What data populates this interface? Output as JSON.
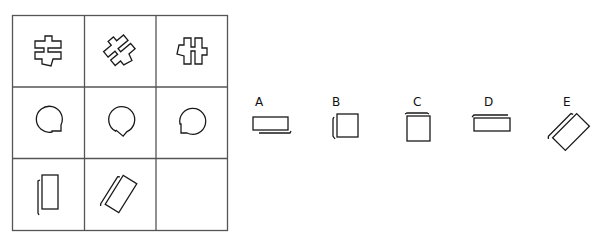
{
  "puzzle": {
    "type": "3x3 figure matrix with missing cell",
    "grid": {
      "rows": 3,
      "cols": 3,
      "cells": [
        {
          "row": 0,
          "col": 0,
          "figure": "cross-puzzle-shape",
          "rotation_deg": 0
        },
        {
          "row": 0,
          "col": 1,
          "figure": "cross-puzzle-shape",
          "rotation_deg": -45
        },
        {
          "row": 0,
          "col": 2,
          "figure": "cross-puzzle-shape",
          "rotation_deg": 90
        },
        {
          "row": 1,
          "col": 0,
          "figure": "speech-bubble-circle",
          "rotation_deg": 0
        },
        {
          "row": 1,
          "col": 1,
          "figure": "speech-bubble-circle",
          "rotation_deg": 45
        },
        {
          "row": 1,
          "col": 2,
          "figure": "speech-bubble-circle",
          "rotation_deg": 90
        },
        {
          "row": 2,
          "col": 0,
          "figure": "rectangle-with-side-line",
          "rotation_deg": 0
        },
        {
          "row": 2,
          "col": 1,
          "figure": "rectangle-with-side-line",
          "rotation_deg": 30
        },
        {
          "row": 2,
          "col": 2,
          "figure": "empty",
          "rotation_deg": null
        }
      ]
    },
    "options": [
      {
        "label": "A",
        "figure": "wide-rectangle-line-below"
      },
      {
        "label": "B",
        "figure": "square-line-left"
      },
      {
        "label": "C",
        "figure": "tall-rectangle-line-above"
      },
      {
        "label": "D",
        "figure": "wide-rectangle-line-above"
      },
      {
        "label": "E",
        "figure": "tilted-rectangle-line-lower-left"
      }
    ]
  },
  "colors": {
    "grid_line": "#555555",
    "figure_stroke": "#1a1a1a",
    "background": "#ffffff"
  }
}
